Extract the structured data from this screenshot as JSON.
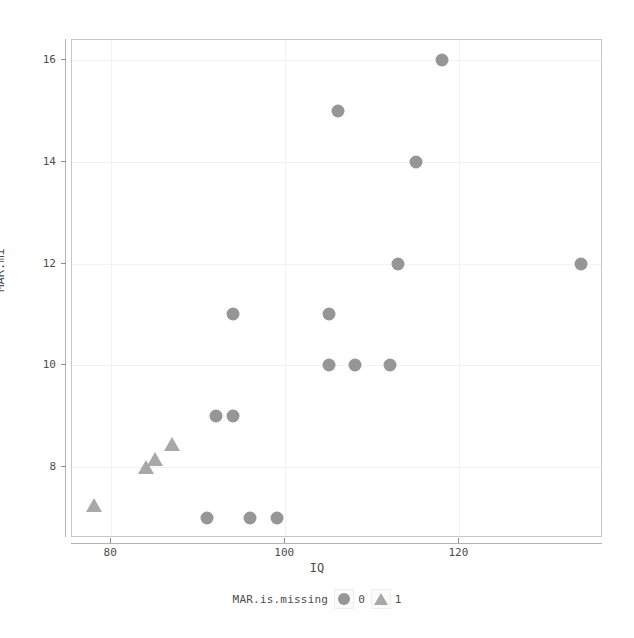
{
  "chart_data": {
    "type": "scatter",
    "title": "",
    "xlabel": "IQ",
    "ylabel": "MAR.mi",
    "xlim": [
      75.5,
      136.5
    ],
    "ylim": [
      6.6,
      16.4
    ],
    "xticks": [
      80,
      100,
      120
    ],
    "yticks": [
      8,
      10,
      12,
      14,
      16
    ],
    "grid": true,
    "legend": {
      "title": "MAR.is.missing",
      "position": "bottom",
      "entries": [
        {
          "label": "0",
          "marker": "circle",
          "color": "#969696"
        },
        {
          "label": "1",
          "marker": "triangle",
          "color": "#a8a8a8"
        }
      ]
    },
    "series": [
      {
        "name": "0",
        "marker": "circle",
        "color": "#969696",
        "points": [
          {
            "x": 118,
            "y": 16
          },
          {
            "x": 106,
            "y": 15
          },
          {
            "x": 115,
            "y": 14
          },
          {
            "x": 113,
            "y": 12
          },
          {
            "x": 134,
            "y": 12
          },
          {
            "x": 94,
            "y": 11
          },
          {
            "x": 105,
            "y": 11
          },
          {
            "x": 105,
            "y": 10
          },
          {
            "x": 108,
            "y": 10
          },
          {
            "x": 112,
            "y": 10
          },
          {
            "x": 92,
            "y": 9
          },
          {
            "x": 94,
            "y": 9
          },
          {
            "x": 91,
            "y": 7
          },
          {
            "x": 96,
            "y": 7
          },
          {
            "x": 99,
            "y": 7
          }
        ]
      },
      {
        "name": "1",
        "marker": "triangle",
        "color": "#a8a8a8",
        "points": [
          {
            "x": 87,
            "y": 8.45
          },
          {
            "x": 85,
            "y": 8.15
          },
          {
            "x": 84,
            "y": 8.0
          },
          {
            "x": 78,
            "y": 7.25
          }
        ]
      }
    ]
  },
  "axes": {
    "x_title": "IQ",
    "y_title": "MAR.mi",
    "x_tick_labels": [
      "80",
      "100",
      "120"
    ],
    "y_tick_labels": [
      "8",
      "10",
      "12",
      "14",
      "16"
    ]
  },
  "legend": {
    "title": "MAR.is.missing",
    "entry_0_label": "0",
    "entry_1_label": "1"
  },
  "colors": {
    "marker_circle": "#969696",
    "marker_triangle": "#a8a8a8",
    "panel_border": "#c8c8c8",
    "grid": "#f2f2f2",
    "text": "#4d4d4d"
  }
}
